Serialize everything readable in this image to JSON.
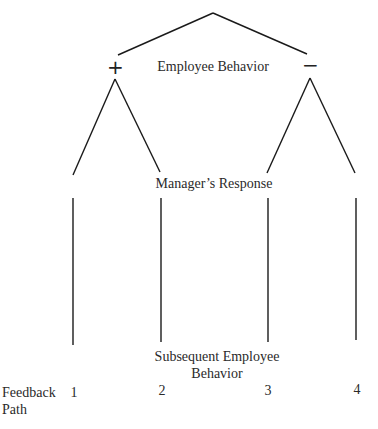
{
  "diagram": {
    "type": "decision-tree",
    "root_label": "Employee Behavior",
    "branches": [
      {
        "sign": "+",
        "name": "positive"
      },
      {
        "sign": "−",
        "name": "negative"
      }
    ],
    "middle_label": "Manager’s Response",
    "bottom_label_line1": "Subsequent Employee",
    "bottom_label_line2": "Behavior",
    "feedback_label_line1": "Feedback",
    "feedback_label_line2": "Path",
    "paths": [
      "1",
      "2",
      "3",
      "4"
    ],
    "line_color": "#1a1a1a"
  }
}
